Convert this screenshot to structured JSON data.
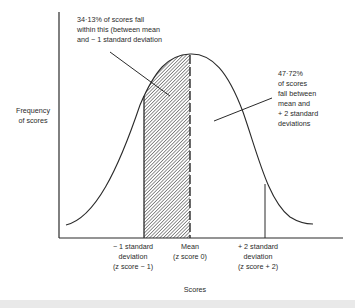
{
  "diagram": {
    "type": "normal-distribution",
    "y_axis_label": [
      "Frequency",
      "of scores"
    ],
    "x_axis_label": "Scores",
    "annotations": {
      "left": [
        "34·13% of scores fall",
        "within this (between mean",
        "and − 1 standard deviation"
      ],
      "right": [
        "47·72%",
        "of scores",
        "fall between",
        "mean and",
        "+ 2 standard",
        "deviations"
      ]
    },
    "markers": [
      {
        "id": "minus1",
        "lines": [
          "− 1 standard",
          "deviation",
          "(z score − 1)"
        ],
        "z": -1,
        "style": "solid"
      },
      {
        "id": "mean",
        "lines": [
          "Mean",
          "(z score 0)"
        ],
        "z": 0,
        "style": "dashed"
      },
      {
        "id": "plus2",
        "lines": [
          "+ 2 standard",
          "deviation",
          "(z score + 2)"
        ],
        "z": 2,
        "style": "solid"
      }
    ],
    "shaded_region": {
      "from_z": -1,
      "to_z": 0,
      "pattern": "diagonal-hatch",
      "percent": "34.13%"
    },
    "colors": {
      "line": "#2a2a2a",
      "hatch": "#444444",
      "background": "#ffffff"
    }
  }
}
